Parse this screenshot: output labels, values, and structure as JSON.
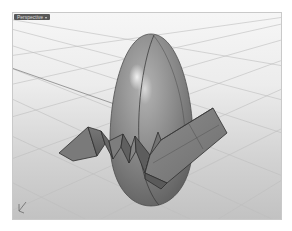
{
  "window": {
    "header_ghost_text": [
      "",
      "",
      "",
      ""
    ]
  },
  "viewport": {
    "label": "Perspective",
    "label_menu_icon": "chevron-down-icon",
    "display_mode": "shaded",
    "colors": {
      "background_top": "#f6f6f6",
      "background_bottom": "#c2c2c2",
      "grid_line": "#b9b9b9",
      "object_fill": "#8a8a8a",
      "object_edge": "#3a3a3a",
      "label_bg": "#585858",
      "label_text": "#d8d8d8"
    },
    "objects": [
      {
        "name": "egg-ellipsoid",
        "type": "surface"
      },
      {
        "name": "zigzag-folded-surface",
        "type": "surface"
      }
    ],
    "axis_gizmo": {
      "icon": "world-axes-icon"
    }
  }
}
